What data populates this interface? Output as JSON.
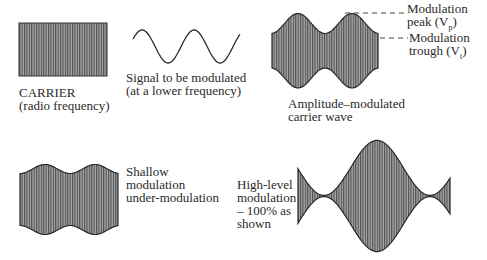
{
  "colors": {
    "ink": "#2a2a2a",
    "fill_gray": "#9a9a9a",
    "hatch": "#555555",
    "background": "#ffffff"
  },
  "diagrams": {
    "carrier": {
      "label_line1": "CARRIER",
      "label_line2": "(radio frequency)"
    },
    "signal": {
      "label_line1": "Signal to be modulated",
      "label_line2": "(at a lower frequency)"
    },
    "am_wave": {
      "label_line1": "Amplitude–modulated",
      "label_line2": "carrier wave",
      "peak_label_line1": "Modulation",
      "peak_label_line2": "peak (V",
      "peak_sub": "p",
      "trough_label_line1": "Modulation",
      "trough_label_line2": "trough (V",
      "trough_sub": "t",
      "close_paren": ")"
    },
    "shallow": {
      "label_line1": "Shallow",
      "label_line2": "modulation",
      "label_line3": "under-modulation"
    },
    "high_level": {
      "label_line1": "High-level",
      "label_line2": "modulation",
      "label_line3": "– 100% as",
      "label_line4": "shown"
    }
  }
}
